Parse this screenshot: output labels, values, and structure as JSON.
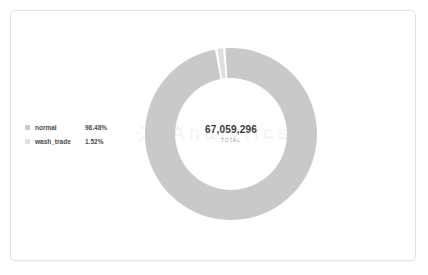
{
  "card": {
    "background": "#ffffff",
    "border_color": "#e2e2e2"
  },
  "watermark": {
    "text": "Analytics",
    "mark": "starburst-logo",
    "color": "#c4c4c4"
  },
  "legend": {
    "position": "left",
    "items": [
      {
        "label": "normal",
        "value": "98.48%",
        "color": "#c9c9c9"
      },
      {
        "label": "wash_trade",
        "value": "1.52%",
        "color": "#e0e0e0"
      }
    ]
  },
  "center": {
    "total": "67,059,296",
    "caption": "TOTAL"
  },
  "chart_data": {
    "type": "pie",
    "variant": "donut",
    "title": "",
    "subtitle": "",
    "xlabel": "",
    "ylabel": "",
    "total": 67059296,
    "total_label": "TOTAL",
    "total_display": "67,059,296",
    "categories": [
      "normal",
      "wash_trade"
    ],
    "values": [
      98.48,
      1.52
    ],
    "value_unit": "percent",
    "labels": [
      "98.48%",
      "1.52%"
    ],
    "colors": [
      "#c9c9c9",
      "#e0e0e0"
    ],
    "legend_position": "left",
    "grid": false,
    "start_angle_deg": -4.5,
    "slice_gap_deg": 1.6,
    "inner_radius_ratio": 0.65,
    "series": [
      {
        "name": "share",
        "values": [
          98.48,
          1.52
        ]
      }
    ]
  }
}
